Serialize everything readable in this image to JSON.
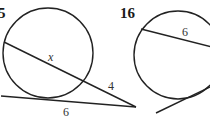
{
  "problems": [
    {
      "number": "5",
      "labels": {
        "secant_internal": "x",
        "secant_external": "4",
        "tangent": "6"
      }
    },
    {
      "number": "16",
      "labels": {
        "chord": "6"
      }
    }
  ],
  "colors": {
    "line": "#222222",
    "text": "#333333",
    "background": "#ffffff"
  }
}
